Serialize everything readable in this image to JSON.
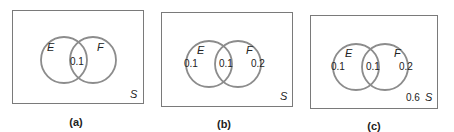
{
  "colors": {
    "box_border": "#7a7a7a",
    "circle_stroke": "#8c8c8c",
    "text": "#222222",
    "background": "#ffffff"
  },
  "panels": [
    {
      "caption": "(a)",
      "sample_space_label": "S",
      "set_e_label": "E",
      "set_f_label": "F",
      "e_only": "",
      "intersection": "0.1",
      "f_only": "",
      "outside": ""
    },
    {
      "caption": "(b)",
      "sample_space_label": "S",
      "set_e_label": "E",
      "set_f_label": "F",
      "e_only": "0.1",
      "intersection": "0.1",
      "f_only": "0.2",
      "outside": ""
    },
    {
      "caption": "(c)",
      "sample_space_label": "S",
      "set_e_label": "E",
      "set_f_label": "F",
      "e_only": "0.1",
      "intersection": "0.1",
      "f_only": "0.2",
      "outside": "0.6"
    }
  ]
}
